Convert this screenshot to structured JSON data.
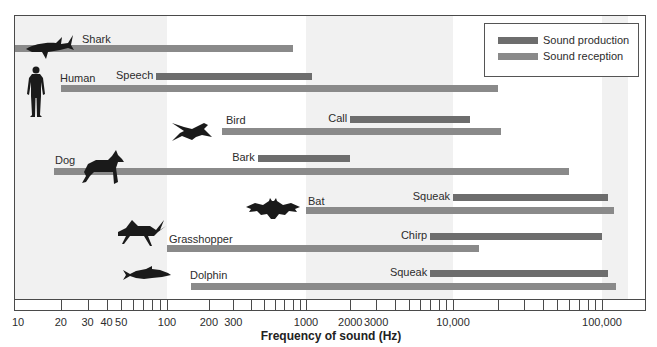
{
  "chart_data": {
    "type": "bar",
    "subtype": "horizontal-range (floating) bars, log x-axis",
    "title": "",
    "xlabel": "Frequency of sound (Hz)",
    "ylabel": "",
    "xscale": "log",
    "xlim": [
      10,
      150000
    ],
    "x_tick_labels": [
      "10",
      "20",
      "30",
      "40",
      "50",
      "100",
      "200",
      "300",
      "1000",
      "2000",
      "3000",
      "10,000",
      "100,000"
    ],
    "grid": false,
    "background_bands": "alternating light gray decades (10–100, 1000–10,000, >100,000)",
    "legend": {
      "position": "upper right",
      "entries": [
        {
          "name": "Sound production",
          "color": "#6d6d6d"
        },
        {
          "name": "Sound reception",
          "color": "#8a8a8a"
        }
      ]
    },
    "series": [
      {
        "animal": "Shark",
        "icon": "shark-icon",
        "reception": {
          "min": 10,
          "max": 800
        }
      },
      {
        "animal": "Human",
        "icon": "human-icon",
        "production": {
          "label": "Speech",
          "min": 85,
          "max": 1100
        },
        "reception": {
          "min": 20,
          "max": 20000
        }
      },
      {
        "animal": "Bird",
        "icon": "bird-icon",
        "production": {
          "label": "Call",
          "min": 2000,
          "max": 13000
        },
        "reception": {
          "min": 250,
          "max": 21000
        }
      },
      {
        "animal": "Dog",
        "icon": "dog-icon",
        "production": {
          "label": "Bark",
          "min": 450,
          "max": 2000
        },
        "reception": {
          "min": 18,
          "max": 60000
        }
      },
      {
        "animal": "Bat",
        "icon": "bat-icon",
        "production": {
          "label": "Squeak",
          "min": 10000,
          "max": 110000
        },
        "reception": {
          "min": 1000,
          "max": 120000
        }
      },
      {
        "animal": "Grasshopper",
        "icon": "grasshopper-icon",
        "production": {
          "label": "Chirp",
          "min": 7000,
          "max": 100000
        },
        "reception": {
          "min": 100,
          "max": 15000
        }
      },
      {
        "animal": "Dolphin",
        "icon": "dolphin-icon",
        "production": {
          "label": "Squeak",
          "min": 7000,
          "max": 110000
        },
        "reception": {
          "min": 150,
          "max": 125000
        }
      }
    ]
  },
  "legend": {
    "production_label": "Sound production",
    "reception_label": "Sound reception"
  },
  "axis": {
    "title": "Frequency of sound (Hz)",
    "labels": [
      "10",
      "20",
      "30 40",
      "50",
      "100",
      "200",
      "300",
      "1000",
      "2000",
      "3000",
      "10,000",
      "100,000"
    ]
  },
  "colors": {
    "production": "#6d6d6d",
    "reception": "#8a8a8a",
    "band": "#f1f1f1",
    "silhouette": "#1a1a1a"
  }
}
